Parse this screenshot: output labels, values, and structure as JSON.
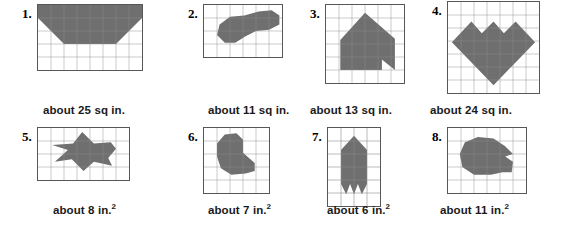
{
  "worksheet": {
    "title": "Estimate the area of each shape",
    "shape_fill_color": "#6f6f6f",
    "grid_line_color": "#8a8a8a",
    "grid_border_color": "#575757",
    "rows": [
      {
        "row_index": 1,
        "unit_label": "sq in.",
        "problems": [
          {
            "number": "1.",
            "caption": "about 25 sq in.",
            "area_value": 25,
            "unit": "sq in.",
            "grid": {
              "cols": 8,
              "rows": 5,
              "cell": 13
            },
            "shape_name": "trapezoid",
            "polygon": "0,0 8,0 8,1 6,3 2,3 0,1"
          },
          {
            "number": "2.",
            "caption": "about 11 sq in.",
            "area_value": 11,
            "unit": "sq in.",
            "grid": {
              "cols": 6,
              "rows": 4,
              "cell": 13
            },
            "shape_name": "bean-blob",
            "polygon": "1.0,2.3 1.2,1.5 2.0,0.9 3.1,0.8 4.2,0.5 5.2,0.4 5.8,0.8 5.8,1.5 5.0,1.9 4.0,2.0 3.2,2.4 2.4,2.9 1.6,2.9"
          },
          {
            "number": "3.",
            "caption": "about 13 sq in.",
            "area_value": 13,
            "unit": "sq in.",
            "grid": {
              "cols": 6,
              "rows": 6,
              "cell": 13
            },
            "shape_name": "house-with-notch",
            "polygon": "3.0,0.6 5.3,2.6 5.3,5.0 4.3,4.2 4.3,5.0 1.1,5.0 1.1,2.7"
          },
          {
            "number": "4.",
            "caption": "about 24 sq in.",
            "area_value": 24,
            "unit": "sq in.",
            "grid": {
              "cols": 7,
              "rows": 7,
              "cell": 13
            },
            "shape_name": "three-peak-heart",
            "polygon": "0.3,3.1 1.8,1.5 2.6,2.4 3.5,1.5 4.3,2.4 5.2,1.5 6.7,3.1 3.5,6.4"
          }
        ]
      },
      {
        "row_index": 2,
        "unit_label": "in.2",
        "problems": [
          {
            "number": "5.",
            "caption_prefix": "about 8 in.",
            "caption_sup": "2",
            "area_value": 8,
            "unit": "in.2",
            "grid": {
              "cols": 7,
              "rows": 4,
              "cell": 13
            },
            "shape_name": "arrow-fish",
            "polygon": "3.4,0.3 4.3,1.2 5.6,1.1 6.0,1.6 5.4,2.3 5.7,2.9 4.3,2.6 3.5,3.3 2.6,2.4 1.3,2.6 2.3,1.7 1.1,1.3 2.7,1.2"
          },
          {
            "number": "6.",
            "caption_prefix": "about 7 in.",
            "caption_sup": "2",
            "area_value": 7,
            "unit": "in.2",
            "grid": {
              "cols": 5,
              "rows": 5,
              "cell": 13
            },
            "shape_name": "rounded-blob",
            "polygon": "1.6,0.5 2.5,0.4 3.0,0.9 3.0,1.9 3.9,2.7 3.9,3.3 3.2,3.5 2.1,3.6 1.3,3.1 1.0,2.2 1.0,1.2"
          },
          {
            "number": "7.",
            "caption_prefix": "about 6 in.",
            "caption_sup": "2",
            "area_value": 6,
            "unit": "in.2",
            "grid": {
              "cols": 4,
              "rows": 6,
              "cell": 13
            },
            "shape_name": "rocket-two-prongs",
            "polygon": "2.0,0.6 3.0,1.7 3.0,4.3 2.6,5.1 2.3,4.3 2.0,5.1 1.7,4.3 1.4,5.1 1.0,4.3 1.0,1.7"
          },
          {
            "number": "8.",
            "caption_prefix": "about 11 in.",
            "caption_sup": "2",
            "area_value": 11,
            "unit": "in.2",
            "grid": {
              "cols": 6,
              "rows": 5,
              "cell": 13
            },
            "shape_name": "blob-with-wedge",
            "polygon": "2.3,0.7 3.5,0.8 4.4,1.4 5.0,2.0 4.4,2.2 5.0,2.6 4.9,3.4 4.2,3.4 3.3,3.6 2.0,3.6 1.1,3.0 0.9,2.0 1.3,1.1"
          }
        ]
      }
    ]
  }
}
